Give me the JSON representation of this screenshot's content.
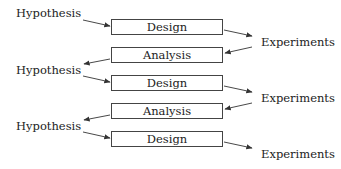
{
  "diagram": {
    "boxes": [
      {
        "label": "Design"
      },
      {
        "label": "Analysis"
      },
      {
        "label": "Design"
      },
      {
        "label": "Analysis"
      },
      {
        "label": "Design"
      }
    ],
    "left_labels": [
      {
        "label": "Hypothesis"
      },
      {
        "label": "Hypothesis"
      },
      {
        "label": "Hypothesis"
      }
    ],
    "right_labels": [
      {
        "label": "Experiments"
      },
      {
        "label": "Experiments"
      },
      {
        "label": "Experiments"
      }
    ],
    "edges": [
      {
        "from": "Hypothesis",
        "to": "Design"
      },
      {
        "from": "Design",
        "to": "Experiments"
      },
      {
        "from": "Experiments",
        "to": "Analysis"
      },
      {
        "from": "Analysis",
        "to": "Hypothesis"
      },
      {
        "from": "Hypothesis",
        "to": "Design"
      },
      {
        "from": "Design",
        "to": "Experiments"
      },
      {
        "from": "Experiments",
        "to": "Analysis"
      },
      {
        "from": "Analysis",
        "to": "Hypothesis"
      },
      {
        "from": "Hypothesis",
        "to": "Design"
      },
      {
        "from": "Design",
        "to": "Experiments"
      }
    ]
  }
}
